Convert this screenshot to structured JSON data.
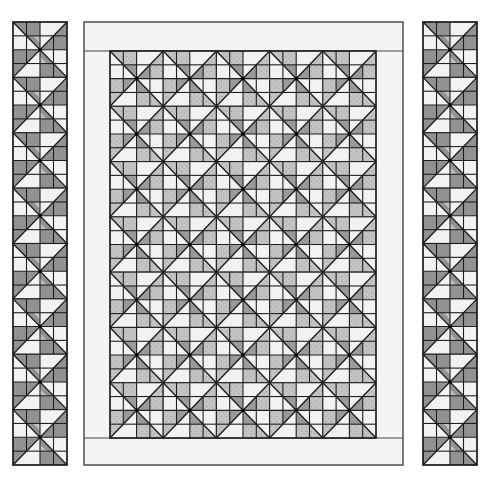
{
  "colors": {
    "background": "#ffffff",
    "light": "#f2f2f2",
    "border_fabric": "#f4f4f4",
    "medium": "#9a9a9a",
    "print": "#c4c4c4",
    "print_dot": "#a8a8a8",
    "dark_check": "#8c8c8c",
    "line": "#1e1e1e",
    "outline": "#444444"
  },
  "quilt": {
    "outer": {
      "x": 84,
      "y": 22,
      "w": 319,
      "h": 443
    },
    "inner": {
      "x": 110,
      "y": 51,
      "w": 266,
      "h": 387
    },
    "columns": 5,
    "rows": 7
  },
  "strips": [
    {
      "name": "left-border-strip",
      "x": 13,
      "y": 22,
      "w": 54,
      "h": 443,
      "blocks": 8
    },
    {
      "name": "right-border-strip",
      "x": 423,
      "y": 22,
      "w": 54,
      "h": 443,
      "blocks": 8
    }
  ]
}
